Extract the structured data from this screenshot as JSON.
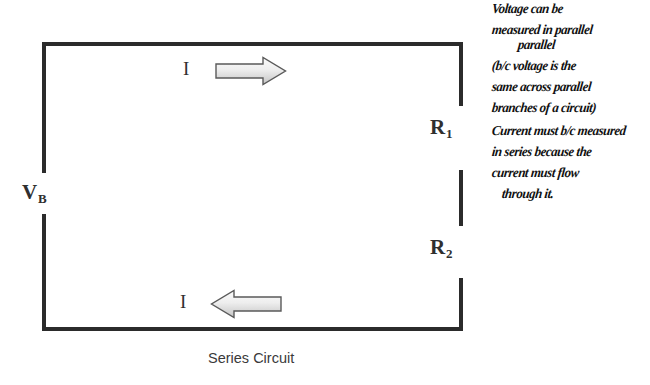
{
  "diagram": {
    "caption": "Series Circuit",
    "battery_label": "V",
    "battery_sub": "B",
    "resistor1_label": "R",
    "resistor1_sub": "1",
    "resistor2_label": "R",
    "resistor2_sub": "2",
    "current_top_label": "I",
    "current_bottom_label": "I",
    "arrow_top_direction": "right",
    "arrow_bottom_direction": "left",
    "wire_color": "#2b2b2b",
    "arrow_fill_light": "#f2f2f2",
    "arrow_fill_dark": "#c8c8c8",
    "arrow_stroke": "#555555"
  },
  "notes": {
    "voltage": [
      "Voltage can be",
      "measured in parallel",
      "parallel",
      "(b/c voltage is the",
      "same across parallel",
      "branches of a circuit)"
    ],
    "current": [
      "Current must b/c measured",
      "in series because the",
      "current must flow",
      "through it."
    ]
  }
}
